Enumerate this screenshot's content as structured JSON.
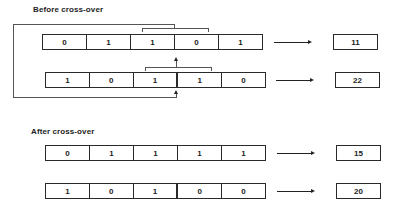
{
  "sections": {
    "before": {
      "title": "Before cross-over",
      "parent1": {
        "genes": [
          "0",
          "1",
          "1",
          "0",
          "1"
        ],
        "fitness": "11"
      },
      "parent2": {
        "genes": [
          "1",
          "0",
          "1",
          "1",
          "0"
        ],
        "fitness": "22"
      }
    },
    "after": {
      "title": "After cross-over",
      "offspring1": {
        "genes": [
          "0",
          "1",
          "1",
          "1",
          "1"
        ],
        "fitness": "15"
      },
      "offspring2": {
        "genes": [
          "1",
          "0",
          "1",
          "0",
          "0"
        ],
        "fitness": "20"
      }
    }
  },
  "colors": {
    "line": "#222222",
    "connector": "#555555",
    "background": "#ffffff"
  },
  "icons": {
    "arrow": "right-arrow-icon",
    "crossover-marker": "up-arrow-icon"
  }
}
